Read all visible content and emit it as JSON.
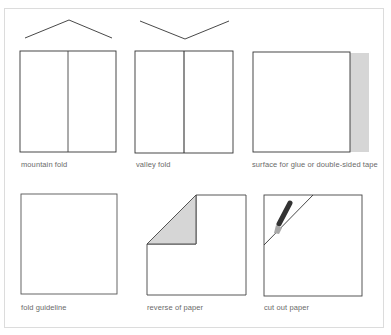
{
  "legend": {
    "items": [
      {
        "key": "mountain",
        "label": "mountain fold",
        "icon": "mountain-fold-icon"
      },
      {
        "key": "valley",
        "label": "valley fold",
        "icon": "valley-fold-icon"
      },
      {
        "key": "glue",
        "label": "surface for glue or double-sided tape",
        "icon": "glue-surface-icon"
      },
      {
        "key": "guideline",
        "label": "fold guideline",
        "icon": "fold-guideline-icon"
      },
      {
        "key": "reverse",
        "label": "reverse of paper",
        "icon": "reverse-paper-icon"
      },
      {
        "key": "cut",
        "label": "cut out paper",
        "icon": "cutter-knife-icon"
      }
    ]
  },
  "colors": {
    "line": "#333333",
    "shade": "#d6d6d6",
    "frame": "#dcdcdc",
    "label": "#6a6a6a",
    "knife_body": "#333333",
    "knife_blade": "#a8a8a8"
  }
}
